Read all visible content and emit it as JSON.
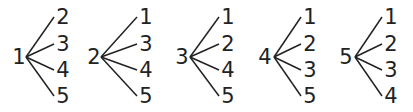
{
  "diagram": {
    "type": "tree",
    "colors": {
      "ink": "#222222",
      "background": "#ffffff"
    },
    "trees": [
      {
        "root": "1",
        "leaves": [
          "2",
          "3",
          "4",
          "5"
        ]
      },
      {
        "root": "2",
        "leaves": [
          "1",
          "3",
          "4",
          "5"
        ]
      },
      {
        "root": "3",
        "leaves": [
          "1",
          "2",
          "4",
          "5"
        ]
      },
      {
        "root": "4",
        "leaves": [
          "1",
          "2",
          "3",
          "5"
        ]
      },
      {
        "root": "5",
        "leaves": [
          "1",
          "2",
          "3",
          "4"
        ]
      }
    ]
  }
}
